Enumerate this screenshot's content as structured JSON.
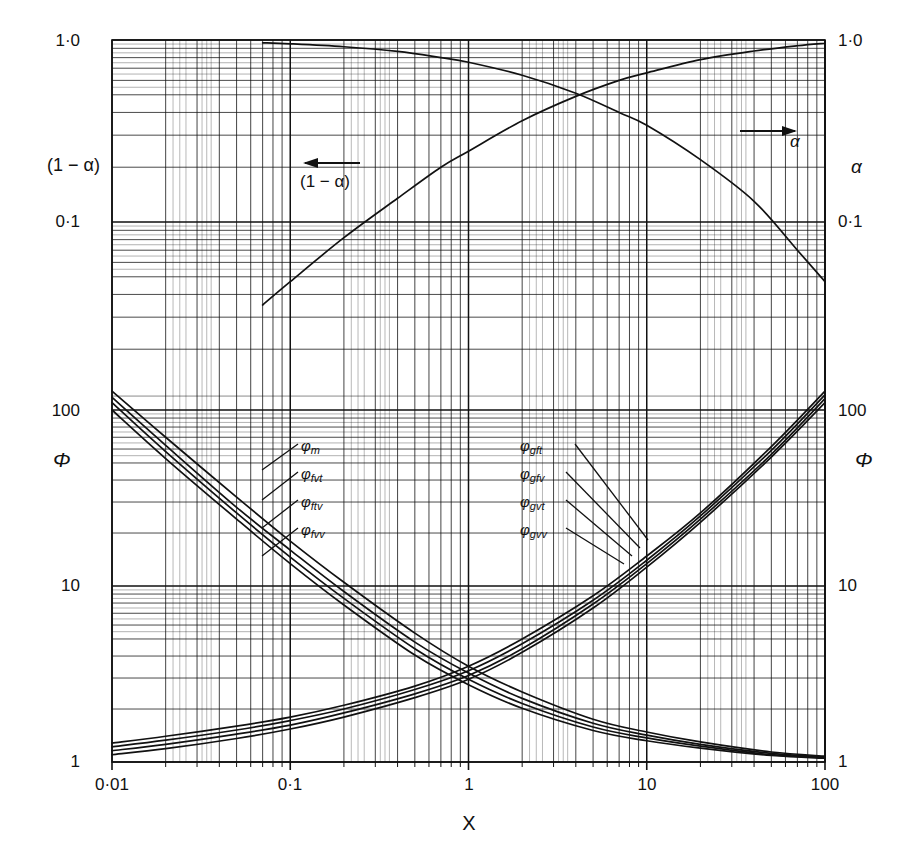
{
  "chart": {
    "type": "line",
    "title": "",
    "xlabel": "X",
    "ylabel_left_upper": "(1 − α)",
    "ylabel_left_lower": "Φ",
    "ylabel_right_upper": "α",
    "ylabel_right_lower": "Φ",
    "x_ticks": [
      "0·01",
      "0·1",
      "1",
      "10",
      "100"
    ],
    "x_tick_values": [
      0.01,
      0.1,
      1,
      10,
      100
    ],
    "y_upper_ticks": [
      "1·0",
      "0·1"
    ],
    "y_upper_tick_values": [
      1.0,
      0.1
    ],
    "y_lower_ticks": [
      "100",
      "10",
      "1"
    ],
    "y_lower_tick_values": [
      100,
      10,
      1
    ],
    "xlim": [
      0.01,
      100
    ],
    "y_upper_lim": [
      0.02,
      1.0
    ],
    "y_lower_lim": [
      1,
      220
    ],
    "grid": "log-log minor grid, both axes",
    "legend": "inline curve labels",
    "annotation_alpha": "α",
    "annotation_one_minus_alpha": "(1 − α)",
    "arrow_one_minus_alpha_direction": "left",
    "arrow_alpha_direction": "right"
  },
  "chart_data": {
    "type": "line",
    "title": "",
    "xlabel": "X",
    "ylabel": "Φ  /  (1−α), α",
    "xlim": [
      0.01,
      100
    ],
    "xscale": "log",
    "yscale": "log",
    "grid": true,
    "legend_position": "inline",
    "panels": [
      {
        "name": "void-fraction-panel",
        "ylabel_left": "(1 − α)",
        "ylabel_right": "α",
        "ylim": [
          0.02,
          1.0
        ],
        "series": [
          {
            "name": "(1 − α)",
            "comment": "rises with X, read on left scale",
            "x": [
              0.07,
              0.1,
              0.2,
              0.4,
              0.7,
              1.0,
              2.0,
              4.0,
              7.0,
              10,
              20,
              40,
              70,
              100
            ],
            "y": [
              0.035,
              0.047,
              0.082,
              0.135,
              0.2,
              0.245,
              0.36,
              0.49,
              0.6,
              0.66,
              0.78,
              0.87,
              0.93,
              0.96
            ]
          },
          {
            "name": "α",
            "comment": "falls with X, read on right scale",
            "x": [
              0.07,
              0.1,
              0.2,
              0.4,
              0.7,
              1.0,
              2.0,
              4.0,
              7.0,
              10,
              20,
              40,
              70,
              100
            ],
            "y": [
              0.965,
              0.953,
              0.918,
              0.865,
              0.8,
              0.755,
              0.64,
              0.51,
              0.4,
              0.34,
              0.22,
              0.13,
              0.07,
              0.047
            ]
          }
        ]
      },
      {
        "name": "phi-panel",
        "ylabel": "Φ",
        "ylim": [
          1,
          220
        ],
        "series": [
          {
            "name": "φm",
            "label": "φ",
            "sub": "m",
            "x": [
              0.01,
              0.02,
              0.05,
              0.1,
              0.2,
              0.5,
              1,
              2,
              5,
              10,
              20,
              50,
              100
            ],
            "y": [
              128,
              70,
              32,
              18,
              10.5,
              5.4,
              3.5,
              2.5,
              1.75,
              1.48,
              1.3,
              1.14,
              1.08
            ]
          },
          {
            "name": "φfvt",
            "label": "φ",
            "sub": "fvt",
            "x": [
              0.01,
              0.02,
              0.05,
              0.1,
              0.2,
              0.5,
              1,
              2,
              5,
              10,
              20,
              50,
              100
            ],
            "y": [
              118,
              63,
              28,
              16,
              9.3,
              4.8,
              3.2,
              2.3,
              1.66,
              1.42,
              1.26,
              1.12,
              1.07
            ]
          },
          {
            "name": "φftv",
            "label": "φ",
            "sub": "ftv",
            "x": [
              0.01,
              0.02,
              0.05,
              0.1,
              0.2,
              0.5,
              1,
              2,
              5,
              10,
              20,
              50,
              100
            ],
            "y": [
              110,
              58,
              26,
              14.6,
              8.5,
              4.4,
              2.95,
              2.15,
              1.58,
              1.37,
              1.23,
              1.1,
              1.06
            ]
          },
          {
            "name": "φfvv",
            "label": "φ",
            "sub": "fvv",
            "x": [
              0.01,
              0.02,
              0.05,
              0.1,
              0.2,
              0.5,
              1,
              2,
              5,
              10,
              20,
              50,
              100
            ],
            "y": [
              100,
              53,
              24,
              13.4,
              7.8,
              4.05,
              2.75,
              2.02,
              1.51,
              1.32,
              1.2,
              1.09,
              1.05
            ]
          },
          {
            "name": "φgft",
            "label": "φ",
            "sub": "gft",
            "x": [
              0.01,
              0.02,
              0.05,
              0.1,
              0.2,
              0.5,
              1,
              2,
              5,
              10,
              20,
              50,
              100
            ],
            "y": [
              1.28,
              1.4,
              1.6,
              1.8,
              2.1,
              2.7,
              3.5,
              5.0,
              8.8,
              14.8,
              26,
              62,
              128
            ]
          },
          {
            "name": "φgfv",
            "label": "φ",
            "sub": "gfv",
            "x": [
              0.01,
              0.02,
              0.05,
              0.1,
              0.2,
              0.5,
              1,
              2,
              5,
              10,
              20,
              50,
              100
            ],
            "y": [
              1.22,
              1.33,
              1.52,
              1.72,
              2.0,
              2.58,
              3.3,
              4.7,
              8.3,
              14.0,
              25,
              59,
              122
            ]
          },
          {
            "name": "φgvt",
            "label": "φ",
            "sub": "gvt",
            "x": [
              0.01,
              0.02,
              0.05,
              0.1,
              0.2,
              0.5,
              1,
              2,
              5,
              10,
              20,
              50,
              100
            ],
            "y": [
              1.16,
              1.26,
              1.44,
              1.62,
              1.9,
              2.44,
              3.1,
              4.4,
              7.9,
              13.4,
              24,
              56,
              116
            ]
          },
          {
            "name": "φgvv",
            "label": "φ",
            "sub": "gvv",
            "x": [
              0.01,
              0.02,
              0.05,
              0.1,
              0.2,
              0.5,
              1,
              2,
              5,
              10,
              20,
              50,
              100
            ],
            "y": [
              1.1,
              1.19,
              1.36,
              1.54,
              1.8,
              2.32,
              2.95,
              4.2,
              7.5,
              12.8,
              23,
              54,
              110
            ]
          }
        ]
      }
    ]
  },
  "curve_labels_left": [
    {
      "base": "φ",
      "sub": "m"
    },
    {
      "base": "φ",
      "sub": "fvt"
    },
    {
      "base": "φ",
      "sub": "ftv"
    },
    {
      "base": "φ",
      "sub": "fvv"
    }
  ],
  "curve_labels_right": [
    {
      "base": "φ",
      "sub": "gft"
    },
    {
      "base": "φ",
      "sub": "gfv"
    },
    {
      "base": "φ",
      "sub": "gvt"
    },
    {
      "base": "φ",
      "sub": "gvv"
    }
  ],
  "colors": {
    "ink": "#111111",
    "grid": "#1a1a1a",
    "background": "#ffffff"
  }
}
